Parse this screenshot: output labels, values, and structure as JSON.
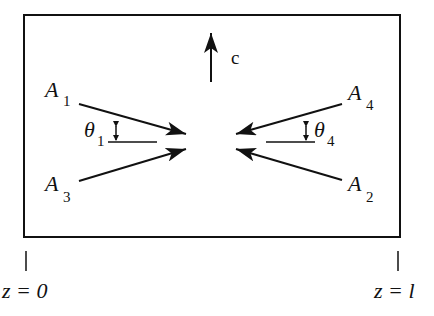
{
  "figure": {
    "type": "diagram",
    "c_axis_label": "c",
    "waves": [
      {
        "name": "A",
        "sub": "1"
      },
      {
        "name": "A",
        "sub": "2"
      },
      {
        "name": "A",
        "sub": "3"
      },
      {
        "name": "A",
        "sub": "4"
      }
    ],
    "angles": [
      {
        "name": "θ",
        "sub": "1"
      },
      {
        "name": "θ",
        "sub": "4"
      }
    ],
    "boundaries": {
      "left": "z = 0",
      "right": "z = l"
    },
    "colors": {
      "stroke": "#111111",
      "background": "#ffffff"
    }
  }
}
